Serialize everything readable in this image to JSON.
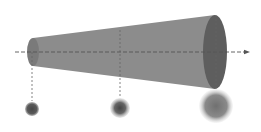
{
  "diagram": {
    "colors": {
      "background": "#ffffff",
      "cone_body": "#8c8c8c",
      "cone_end_small": "#7a7a7a",
      "cone_end_large": "#5e5e5e",
      "axis": "#555555",
      "guide": "#666666",
      "spot_small_core": "#4a4a4a",
      "spot_mid_core": "#4f4f4f",
      "spot_large_core": "#707070"
    },
    "axis": {
      "x1": 15,
      "x2": 250,
      "y": 52,
      "arrow": "right"
    },
    "cone": {
      "small_end": {
        "cx": 33,
        "cy": 52,
        "rx": 6,
        "ry": 14
      },
      "large_end": {
        "cx": 215,
        "cy": 52,
        "rx": 12,
        "ry": 37
      }
    },
    "guides": [
      {
        "x": 32,
        "y1": 52,
        "y2": 101
      },
      {
        "x": 120,
        "y1": 30,
        "y2": 98
      },
      {
        "x": 216,
        "y1": 15,
        "y2": 89
      }
    ],
    "spots": [
      {
        "label": "spot-small",
        "cx": 32,
        "cy": 109,
        "r": 7
      },
      {
        "label": "spot-medium",
        "cx": 120,
        "cy": 108,
        "r": 10
      },
      {
        "label": "spot-large",
        "cx": 216,
        "cy": 106,
        "r": 17
      }
    ]
  }
}
